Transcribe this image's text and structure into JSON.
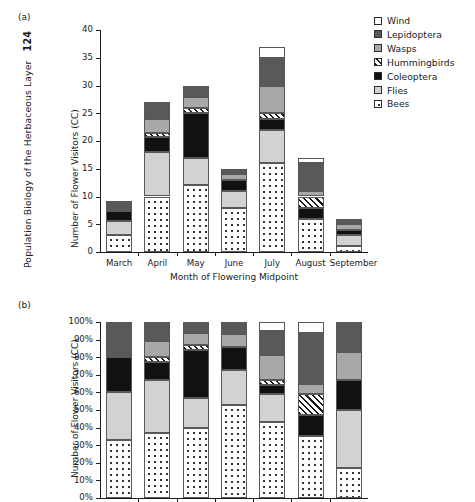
{
  "running_head": {
    "text": "Population Biology of the Herbaceous Layer",
    "page_number": "124"
  },
  "legend": {
    "position": "top-right",
    "items": [
      {
        "label": "Wind",
        "key": "wind",
        "icon": "legend-swatch-wind"
      },
      {
        "label": "Lepidoptera",
        "key": "lepidoptera",
        "icon": "legend-swatch-lepidoptera"
      },
      {
        "label": "Wasps",
        "key": "wasps",
        "icon": "legend-swatch-wasps"
      },
      {
        "label": "Hummingbirds",
        "key": "hummingbirds",
        "icon": "legend-swatch-hummingbirds"
      },
      {
        "label": "Coleoptera",
        "key": "coleoptera",
        "icon": "legend-swatch-coleoptera"
      },
      {
        "label": "Flies",
        "key": "flies",
        "icon": "legend-swatch-flies"
      },
      {
        "label": "Bees",
        "key": "bees",
        "icon": "legend-swatch-bees"
      }
    ]
  },
  "colors": {
    "wind": "#ffffff",
    "lepidoptera": "#595959",
    "wasps": "#a8a8a8",
    "hummingbirds": "#ffffff",
    "coleoptera": "#111111",
    "flies": "#d2d2d2",
    "bees": "#ffffff",
    "axis": "#1a1a1a",
    "segment_border": "#585858"
  },
  "panels": [
    {
      "tag": "(a)",
      "name": "panel-a"
    },
    {
      "tag": "(b)",
      "name": "panel-b"
    }
  ],
  "chart_data": [
    {
      "type": "bar",
      "name": "panel-a-counts",
      "stacked": true,
      "title": "",
      "panel_tag": "(a)",
      "xlabel": "Month of Flowering Midpoint",
      "ylabel": "Number of Flower Visitors (CC)",
      "categories": [
        "March",
        "April",
        "May",
        "June",
        "July",
        "August",
        "September"
      ],
      "ylim": [
        0,
        40
      ],
      "yticks": [
        0,
        5,
        10,
        15,
        20,
        25,
        30,
        35,
        40
      ],
      "ytick_labels": [
        "0",
        "5",
        "10",
        "15",
        "20",
        "25",
        "30",
        "35",
        "40"
      ],
      "grid": false,
      "legend": true,
      "series": [
        {
          "name": "Bees",
          "key": "bees",
          "values": [
            3,
            10,
            12,
            8,
            16,
            6,
            1
          ]
        },
        {
          "name": "Flies",
          "key": "flies",
          "values": [
            2.5,
            8,
            5,
            3,
            6,
            0,
            2
          ]
        },
        {
          "name": "Coleoptera",
          "key": "coleoptera",
          "values": [
            1.8,
            2.7,
            8,
            2,
            2,
            2,
            1
          ]
        },
        {
          "name": "Hummingbirds",
          "key": "hummingbirds",
          "values": [
            0,
            0.8,
            1,
            0,
            1,
            2,
            0
          ]
        },
        {
          "name": "Wasps",
          "key": "wasps",
          "values": [
            0,
            2.5,
            2,
            1,
            5,
            1,
            1
          ]
        },
        {
          "name": "Lepidoptera",
          "key": "lepidoptera",
          "values": [
            1.9,
            3,
            2,
            1,
            5,
            5,
            1
          ]
        },
        {
          "name": "Wind",
          "key": "wind",
          "values": [
            0,
            0,
            0,
            0,
            2,
            1,
            0
          ]
        }
      ],
      "totals": [
        9.2,
        27,
        30,
        15,
        37,
        17,
        6
      ]
    },
    {
      "type": "bar",
      "name": "panel-b-percent",
      "stacked": true,
      "normalized": true,
      "title": "",
      "panel_tag": "(b)",
      "xlabel": "",
      "ylabel": "Number of Flower Visitors (CC)",
      "categories": [
        "March",
        "April",
        "May",
        "June",
        "July",
        "August",
        "September"
      ],
      "ylim": [
        0,
        100
      ],
      "yticks": [
        0,
        10,
        20,
        30,
        40,
        50,
        60,
        70,
        80,
        90,
        100
      ],
      "ytick_labels": [
        "0%",
        "10%",
        "20%",
        "30%",
        "40%",
        "50%",
        "60%",
        "70%",
        "80%",
        "90%",
        "100%"
      ],
      "grid": false,
      "legend": false,
      "series": [
        {
          "name": "Bees",
          "key": "bees",
          "values": [
            33,
            37,
            40,
            53,
            43,
            35,
            17
          ]
        },
        {
          "name": "Flies",
          "key": "flies",
          "values": [
            27,
            30,
            17,
            20,
            16,
            0,
            33
          ]
        },
        {
          "name": "Coleoptera",
          "key": "coleoptera",
          "values": [
            20,
            10,
            27,
            13,
            5,
            12,
            17
          ]
        },
        {
          "name": "Hummingbirds",
          "key": "hummingbirds",
          "values": [
            0,
            3,
            3,
            0,
            3,
            12,
            0
          ]
        },
        {
          "name": "Wasps",
          "key": "wasps",
          "values": [
            0,
            9,
            7,
            7,
            14,
            6,
            16
          ]
        },
        {
          "name": "Lepidoptera",
          "key": "lepidoptera",
          "values": [
            20,
            11,
            6,
            7,
            14,
            29,
            17
          ]
        },
        {
          "name": "Wind",
          "key": "wind",
          "values": [
            0,
            0,
            0,
            0,
            5,
            6,
            0
          ]
        }
      ]
    }
  ]
}
